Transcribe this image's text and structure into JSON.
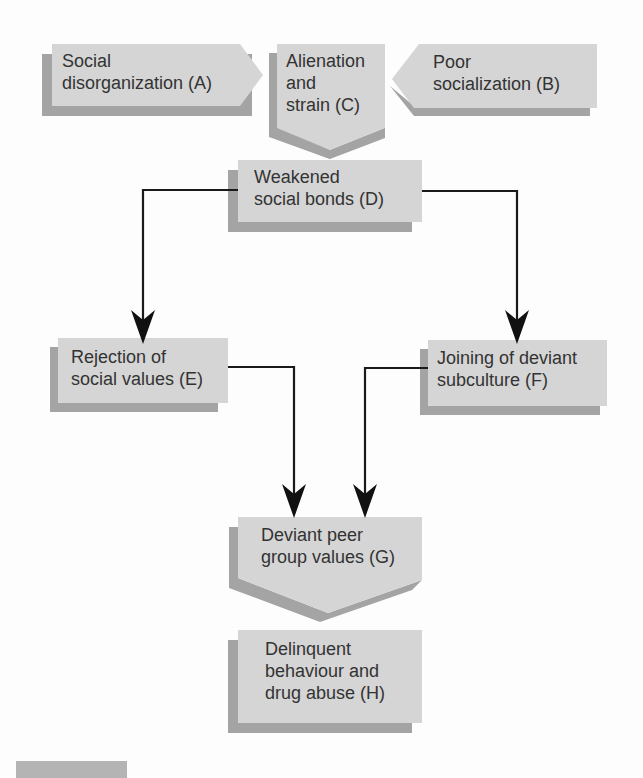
{
  "diagram": {
    "nodes": {
      "A": {
        "lines": [
          "Social",
          "disorganization (A)"
        ]
      },
      "B": {
        "lines": [
          "Poor",
          "socialization (B)"
        ]
      },
      "C": {
        "lines": [
          "Alienation",
          "and",
          "strain (C)"
        ]
      },
      "D": {
        "lines": [
          "Weakened",
          "social bonds (D)"
        ]
      },
      "E": {
        "lines": [
          "Rejection of",
          "social values (E)"
        ]
      },
      "F": {
        "lines": [
          "Joining of deviant",
          "subculture (F)"
        ]
      },
      "G": {
        "lines": [
          "Deviant peer",
          "group values (G)"
        ]
      },
      "H": {
        "lines": [
          "Delinquent",
          "behaviour and",
          "drug abuse (H)"
        ]
      }
    },
    "edges": [
      {
        "from": "A",
        "to": "C"
      },
      {
        "from": "B",
        "to": "C"
      },
      {
        "from": "C",
        "to": "D"
      },
      {
        "from": "D",
        "to": "E"
      },
      {
        "from": "D",
        "to": "F"
      },
      {
        "from": "E",
        "to": "G"
      },
      {
        "from": "F",
        "to": "G"
      },
      {
        "from": "G",
        "to": "H"
      }
    ],
    "colors": {
      "face": "#d5d5d5",
      "shadow": "#a4a4a4",
      "line": "#1a1a1a",
      "text": "#333333"
    }
  }
}
